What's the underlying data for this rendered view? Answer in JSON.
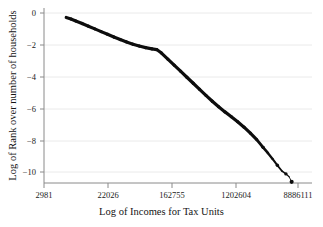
{
  "chart_data": {
    "type": "line",
    "title": "",
    "xlabel": "Log of Incomes for Tax Units",
    "ylabel": "Log of Rank over number of households",
    "xtick_labels": [
      "2981",
      "22026",
      "162755",
      "1202604",
      "8886111"
    ],
    "xtick_values": [
      8,
      10,
      12,
      14,
      16
    ],
    "ytick_labels": [
      "0",
      "−2",
      "−4",
      "−6",
      "−8",
      "−10"
    ],
    "ytick_values": [
      0,
      -2,
      -4,
      -6,
      -8,
      -10
    ],
    "xlim": [
      8,
      16
    ],
    "ylim": [
      -11.1,
      0.25
    ],
    "grid": "horizontal",
    "grid_color": "#e2e2e2",
    "axis_color": "#808080",
    "series_color": "#0d0d0d",
    "legend": "none",
    "series": [
      {
        "name": "Log rank vs log income",
        "x": [
          8.7,
          8.85,
          9.0,
          9.2,
          9.4,
          9.6,
          9.8,
          10.0,
          10.2,
          10.4,
          10.6,
          10.8,
          11.0,
          11.2,
          11.4,
          11.55,
          11.7,
          11.9,
          12.1,
          12.3,
          12.5,
          12.7,
          12.9,
          13.1,
          13.3,
          13.5,
          13.7,
          13.9,
          14.1,
          14.3,
          14.5,
          14.7,
          14.9,
          15.05,
          15.2,
          15.35,
          15.5,
          15.62,
          15.72,
          15.8
        ],
        "y": [
          -0.28,
          -0.38,
          -0.5,
          -0.66,
          -0.83,
          -1.0,
          -1.17,
          -1.34,
          -1.51,
          -1.67,
          -1.82,
          -1.96,
          -2.08,
          -2.18,
          -2.26,
          -2.3,
          -2.52,
          -2.9,
          -3.28,
          -3.66,
          -4.04,
          -4.42,
          -4.8,
          -5.18,
          -5.55,
          -5.9,
          -6.22,
          -6.52,
          -6.84,
          -7.18,
          -7.56,
          -7.96,
          -8.45,
          -8.8,
          -9.18,
          -9.58,
          -9.95,
          -10.12,
          -10.3,
          -10.62
        ],
        "marker": "dot",
        "linewidth_head": 3.2,
        "linewidth_tail": 0.9
      }
    ],
    "endpoint_marker": {
      "x": 15.8,
      "y": -10.62,
      "size": 3.2,
      "color": "#0d0d0d"
    }
  },
  "axes": {
    "x_tick_positions_px": [
      44,
      108,
      172,
      236,
      298
    ],
    "y_tick_positions_px": [
      13,
      45,
      77,
      109,
      141,
      172
    ],
    "plot_left_px": 44,
    "plot_right_px": 312,
    "plot_top_px": 8,
    "plot_bottom_px": 183
  }
}
